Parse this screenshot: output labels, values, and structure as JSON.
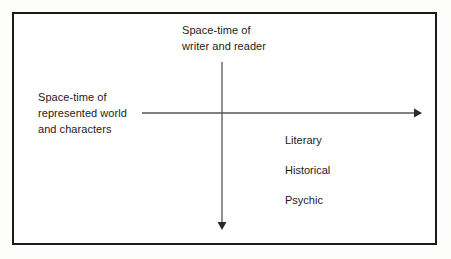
{
  "figure": {
    "background_color": "#ffffff",
    "border_color": "#1a1a1a",
    "axis_color": "#555555",
    "text_color": "#1b1b1b"
  },
  "axes": {
    "vertical": {
      "label_line1": "Space-time of",
      "label_line2": "writer and reader",
      "direction": "down",
      "arrow_name": "vertical-axis-arrow"
    },
    "horizontal": {
      "label_line1": "Space-time of",
      "label_line2": "represented world",
      "label_line3": "and characters",
      "direction": "right",
      "arrow_name": "horizontal-axis-arrow"
    }
  },
  "terms": [
    {
      "label": "Literary"
    },
    {
      "label": "Historical"
    },
    {
      "label": "Psychic"
    }
  ]
}
